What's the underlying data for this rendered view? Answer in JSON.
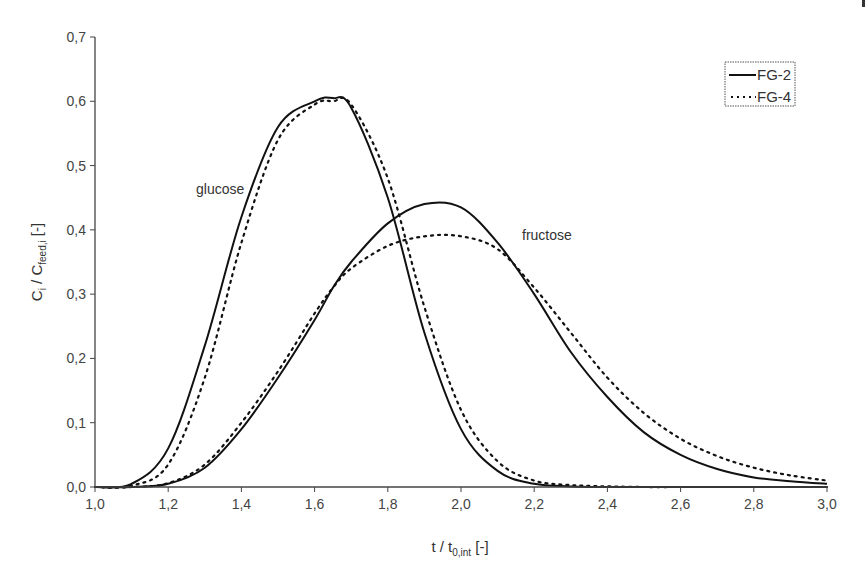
{
  "chart_data": {
    "type": "line",
    "title": "",
    "xlabel": "t / t_0,int [-]",
    "xlabel_parts": {
      "main": "t / t",
      "sub": "0,int",
      "unit": " [-]"
    },
    "ylabel": "C_i / C_feed,i [-]",
    "ylabel_parts": {
      "c1": "C",
      "sub1": "i",
      "mid": " / C",
      "sub2": "feed,i",
      "unit": " [-]"
    },
    "xlim": [
      1.0,
      3.0
    ],
    "ylim": [
      0.0,
      0.7
    ],
    "x_ticks": [
      "1,0",
      "1,2",
      "1,4",
      "1,6",
      "1,8",
      "2,0",
      "2,2",
      "2,4",
      "2,6",
      "2,8",
      "3,0"
    ],
    "y_ticks": [
      "0,0",
      "0,1",
      "0,2",
      "0,3",
      "0,4",
      "0,5",
      "0,6",
      "0,7"
    ],
    "grid": false,
    "legend_position": "upper right",
    "legend": [
      {
        "label": "FG-2",
        "style": "solid"
      },
      {
        "label": "FG-4",
        "style": "dotted"
      }
    ],
    "annotations": [
      {
        "text": "glucose",
        "x": 1.45,
        "y": 0.44
      },
      {
        "text": "fructose",
        "x": 2.25,
        "y": 0.39
      }
    ],
    "x": [
      1.0,
      1.1,
      1.2,
      1.3,
      1.4,
      1.5,
      1.6,
      1.65,
      1.7,
      1.8,
      1.9,
      2.0,
      2.1,
      2.2,
      2.3,
      2.4,
      2.5,
      2.6,
      2.7,
      2.8,
      2.9,
      3.0
    ],
    "series": [
      {
        "name": "FG-2 glucose",
        "component": "glucose",
        "style": "solid",
        "values": [
          0.0,
          0.005,
          0.06,
          0.22,
          0.42,
          0.56,
          0.6,
          0.605,
          0.59,
          0.45,
          0.24,
          0.09,
          0.025,
          0.005,
          0.001,
          0,
          0,
          0,
          0,
          0,
          0,
          0
        ]
      },
      {
        "name": "FG-4 glucose",
        "component": "glucose",
        "style": "dotted",
        "values": [
          0.0,
          0.002,
          0.035,
          0.17,
          0.38,
          0.54,
          0.595,
          0.6,
          0.595,
          0.48,
          0.28,
          0.12,
          0.04,
          0.01,
          0.003,
          0.001,
          0,
          0,
          0,
          0,
          0,
          0
        ]
      },
      {
        "name": "FG-2 fructose",
        "component": "fructose",
        "style": "solid",
        "values": [
          0.0,
          0.0,
          0.005,
          0.03,
          0.09,
          0.17,
          0.26,
          0.31,
          0.35,
          0.41,
          0.44,
          0.435,
          0.38,
          0.3,
          0.21,
          0.14,
          0.085,
          0.05,
          0.028,
          0.015,
          0.009,
          0.005
        ]
      },
      {
        "name": "FG-4 fructose",
        "component": "fructose",
        "style": "dotted",
        "values": [
          0.0,
          0.0,
          0.006,
          0.035,
          0.1,
          0.18,
          0.27,
          0.31,
          0.34,
          0.375,
          0.39,
          0.39,
          0.37,
          0.31,
          0.24,
          0.17,
          0.115,
          0.075,
          0.048,
          0.03,
          0.018,
          0.01
        ]
      }
    ]
  },
  "colors": {
    "axis": "#444444",
    "line": "#111111",
    "text": "#333333",
    "background": "#ffffff"
  }
}
